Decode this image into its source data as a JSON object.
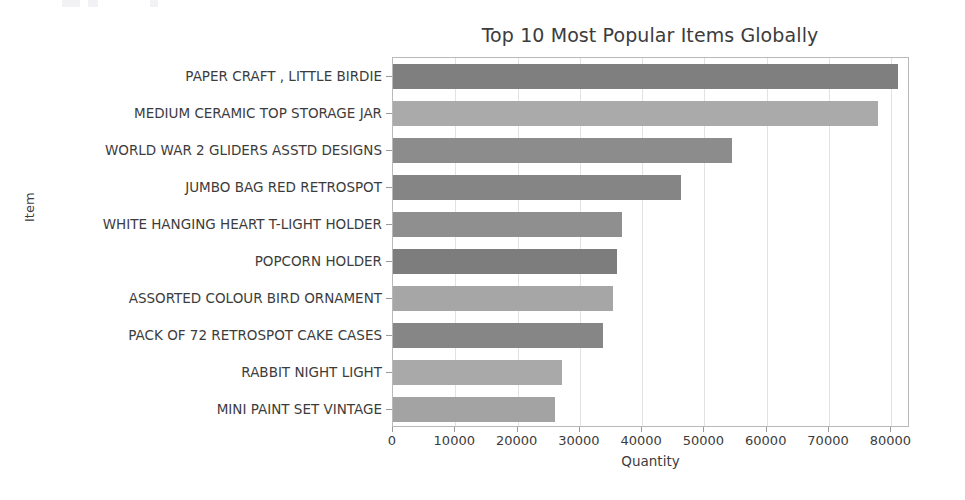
{
  "chart_data": {
    "type": "bar",
    "orientation": "horizontal",
    "title": "Top 10 Most Popular Items Globally",
    "xlabel": "Quantity",
    "ylabel": "Item",
    "xlim": [
      0,
      83000
    ],
    "ylim": null,
    "grid": true,
    "grid_axis": "x",
    "legend": null,
    "xticks": [
      0,
      10000,
      20000,
      30000,
      40000,
      50000,
      60000,
      70000,
      80000
    ],
    "xtick_labels": [
      "0",
      "10000",
      "20000",
      "30000",
      "40000",
      "50000",
      "60000",
      "70000",
      "80000"
    ],
    "categories": [
      "PAPER CRAFT , LITTLE BIRDIE",
      "MEDIUM CERAMIC TOP STORAGE JAR",
      "WORLD WAR 2 GLIDERS ASSTD DESIGNS",
      "JUMBO BAG RED RETROSPOT",
      "WHITE HANGING HEART T-LIGHT HOLDER",
      "POPCORN HOLDER",
      "ASSORTED COLOUR BIRD ORNAMENT",
      "PACK OF 72 RETROSPOT CAKE CASES",
      "RABBIT NIGHT LIGHT",
      "MINI PAINT SET VINTAGE"
    ],
    "values": [
      80995,
      77916,
      54415,
      46181,
      36725,
      36039,
      35314,
      33693,
      27202,
      26076
    ],
    "bar_colors": [
      "#7f7f7f",
      "#aaaaaa",
      "#8c8c8c",
      "#858585",
      "#8f8f8f",
      "#7d7d7d",
      "#a6a6a6",
      "#868686",
      "#a9a9a9",
      "#a3a3a3"
    ]
  },
  "colors": {
    "axis": "#b9b9b9",
    "grid": "#e2e2e2",
    "text": "#3c3c3c",
    "background": "#ffffff"
  }
}
